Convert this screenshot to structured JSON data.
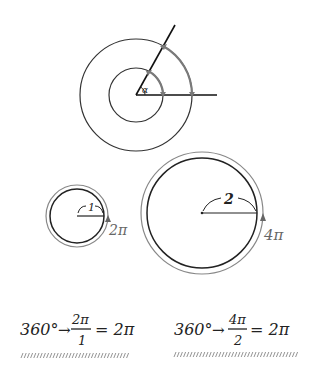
{
  "colors": {
    "ink": "#222222",
    "arc_gray": "#7a7a7a",
    "hatch": "#888888",
    "background": "#ffffff"
  },
  "top_diagram": {
    "angle_label": "α"
  },
  "small_circle": {
    "radius_label": "1",
    "circumference_label": "2π"
  },
  "large_circle": {
    "radius_label": "2",
    "circumference_label": "4π"
  },
  "equations": [
    {
      "lhs": "360°",
      "arrow": "→",
      "numerator": "2π",
      "denominator": "1",
      "rhs": "= 2π"
    },
    {
      "lhs": "360°",
      "arrow": "→",
      "numerator": "4π",
      "denominator": "2",
      "rhs": "= 2π"
    }
  ]
}
